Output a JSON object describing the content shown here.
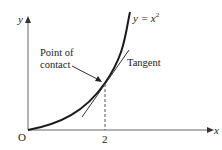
{
  "diagram": {
    "type": "function-graph",
    "axes": {
      "x_label": "x",
      "y_label": "y",
      "origin_label": "O"
    },
    "curve_label": "y = x",
    "curve_exponent": "2",
    "x_tick_label": "2",
    "annotations": {
      "point_of_contact_line1": "Point of",
      "point_of_contact_line2": "contact",
      "tangent": "Tangent"
    },
    "colors": {
      "line": "#1a1a1a",
      "axis": "#555555",
      "background": "#ffffff"
    }
  }
}
